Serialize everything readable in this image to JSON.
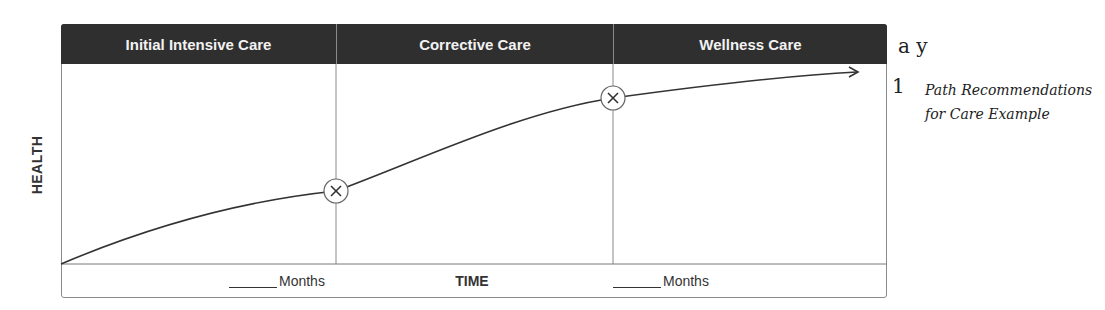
{
  "diagram": {
    "phases": [
      {
        "label": "Initial Intensive Care"
      },
      {
        "label": "Corrective Care"
      },
      {
        "label": "Wellness Care"
      }
    ],
    "y_axis_label": "HEALTH",
    "x_axis_label": "TIME",
    "duration_labels": [
      {
        "blank": "_____",
        "unit": "Months"
      },
      {
        "blank": "_____",
        "unit": "Months"
      }
    ],
    "transition_markers": [
      {
        "icon": "circled-x-icon",
        "between": [
          "Initial Intensive Care",
          "Corrective Care"
        ]
      },
      {
        "icon": "circled-x-icon",
        "between": [
          "Corrective Care",
          "Wellness Care"
        ]
      }
    ],
    "curve": "rising health curve with arrow, flattening over time",
    "colors": {
      "header_bg": "#2f2f2f",
      "header_text": "#f2f2f2",
      "line": "#333333",
      "grid": "#8a8a8a"
    }
  },
  "side_text": {
    "fragment_top": "a y",
    "number": "1",
    "caption": "Path Recommendations for Care Example"
  }
}
